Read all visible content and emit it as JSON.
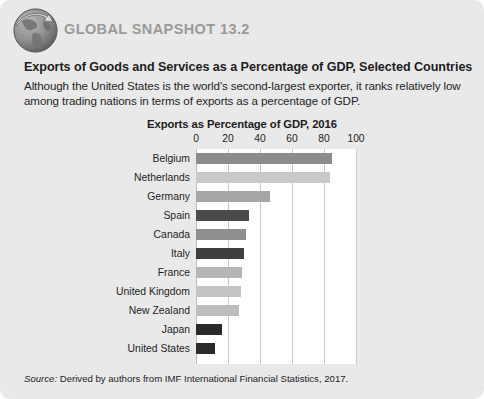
{
  "header": {
    "icon": "globe-arrow-icon",
    "snapshot_label": "GLOBAL SNAPSHOT 13.2",
    "snapshot_color": "#9a9a9a"
  },
  "headline": "Exports of Goods and Services as a Percentage of GDP, Selected Countries",
  "blurb": "Although the United States is the world's second-largest exporter, it ranks relatively low among trading nations in terms of exports as a percentage of GDP.",
  "source": {
    "prefix": "Source:",
    "text": " Derived by authors from IMF International Financial Statistics, 2017."
  },
  "chart_data": {
    "type": "bar",
    "orientation": "horizontal",
    "title": "Exports as Percentage of GDP, 2016",
    "xlabel": "",
    "ylabel": "",
    "xlim": [
      0,
      100
    ],
    "xticks": [
      0,
      20,
      40,
      60,
      80,
      100
    ],
    "tick_labels": [
      "0",
      "20",
      "40",
      "60",
      "80",
      "100"
    ],
    "grid": true,
    "legend": "none",
    "categories": [
      "Belgium",
      "Netherlands",
      "Germany",
      "Spain",
      "Canada",
      "Italy",
      "France",
      "United Kingdom",
      "New Zealand",
      "Japan",
      "United States"
    ],
    "values": [
      85,
      84,
      46,
      33,
      31,
      30,
      29,
      28,
      27,
      16,
      12
    ],
    "bar_colors": [
      "#8c8c8c",
      "#c9c9c9",
      "#a6a6a6",
      "#4a4a4a",
      "#8f8f8f",
      "#3f3f3f",
      "#b5b5b5",
      "#c4c4c4",
      "#bdbdbd",
      "#2b2b2b",
      "#2b2b2b"
    ]
  }
}
